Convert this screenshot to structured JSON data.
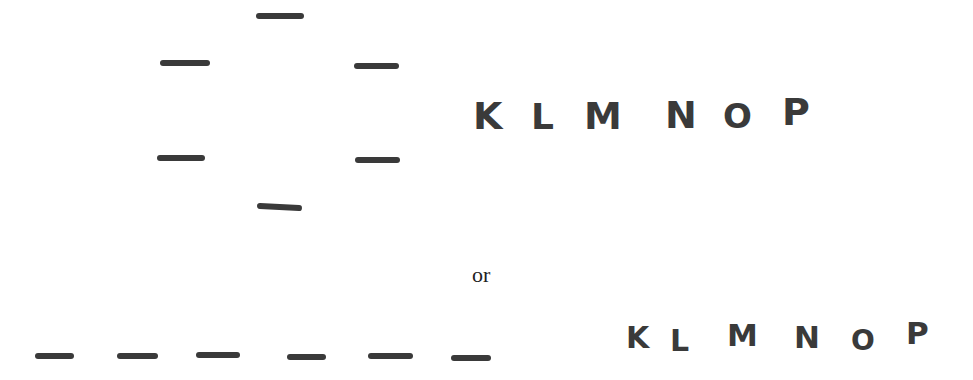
{
  "figure": {
    "top": {
      "letters": [
        "K",
        "L",
        "M",
        "N",
        "O",
        "P"
      ],
      "dash_count": 6,
      "arrangement": "circle"
    },
    "connector_text": "or",
    "bottom": {
      "letters": [
        "K",
        "L",
        "M",
        "N",
        "O",
        "P"
      ],
      "dash_count": 6,
      "arrangement": "line"
    }
  }
}
